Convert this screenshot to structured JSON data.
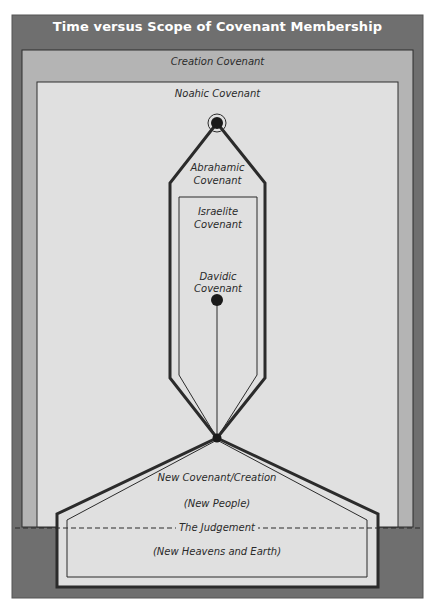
{
  "title": "Time versus Scope of Covenant Membership",
  "colors": {
    "outer_frame": "#6f6f6f",
    "creation_fill": "#b4b4b4",
    "noahic_fill": "#e0e0e0",
    "line": "#2b2b2b",
    "title_text": "#ffffff"
  },
  "labels": {
    "creation": "Creation Covenant",
    "noahic": "Noahic Covenant",
    "abrahamic_1": "Abrahamic",
    "abrahamic_2": "Covenant",
    "israelite_1": "Israelite",
    "israelite_2": "Covenant",
    "davidic_1": "Davidic",
    "davidic_2": "Covenant",
    "new_covenant": "New Covenant/Creation",
    "new_people": "(New People)",
    "judgement": "The Judgement",
    "new_heavens": "(New Heavens and Earth)"
  }
}
